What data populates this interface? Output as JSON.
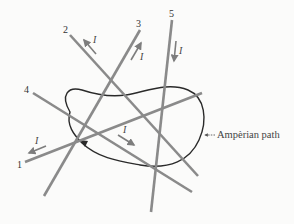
{
  "figure": {
    "title": "",
    "path_label": "Ampèrian path",
    "current_symbol": "I",
    "colors": {
      "wire": "#8a8a8a",
      "path": "#2a2a2a",
      "background": "#fbfbfa"
    }
  },
  "wires": [
    {
      "id": "1",
      "label": "1",
      "current_label": "I",
      "current_direction": "toward label end (down-left)"
    },
    {
      "id": "2",
      "label": "2",
      "current_label": "I",
      "current_direction": "toward label end (up-left)"
    },
    {
      "id": "3",
      "label": "3",
      "current_label": "I",
      "current_direction": "toward label end (up-right)"
    },
    {
      "id": "4",
      "label": "4",
      "current_label": "I",
      "current_direction": "away from label (down-right)"
    },
    {
      "id": "5",
      "label": "5",
      "current_label": "I",
      "current_direction": "away from label (down)"
    }
  ]
}
